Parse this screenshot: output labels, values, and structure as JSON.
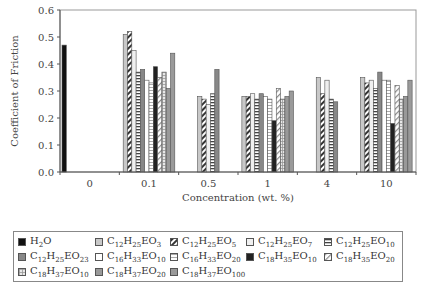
{
  "chart_data": {
    "type": "bar",
    "title": "",
    "xlabel": "Concentration (wt. %)",
    "ylabel": "Coefficient of Friction",
    "ylim": [
      0.0,
      0.6
    ],
    "yticks": [
      "0.0",
      "0.1",
      "0.2",
      "0.3",
      "0.4",
      "0.5",
      "0.6"
    ],
    "grid": false,
    "legend_position": "bottom",
    "categories": [
      "0",
      "0.1",
      "0.5",
      "1",
      "4",
      "10"
    ],
    "series": [
      {
        "name": "H2O",
        "label_html": "H<sub>2</sub>O",
        "fill": "#111111",
        "pattern": "solid",
        "values": [
          0.47,
          null,
          null,
          null,
          null,
          null
        ]
      },
      {
        "name": "C12H25EO3",
        "label_html": "C<sub>12</sub>H<sub>25</sub>EO<sub>3</sub>",
        "fill": "#c8c8c8",
        "pattern": "solid",
        "values": [
          null,
          0.51,
          0.28,
          0.28,
          0.35,
          0.35
        ]
      },
      {
        "name": "C12H25EO5",
        "label_html": "C<sub>12</sub>H<sub>25</sub>EO<sub>5</sub>",
        "fill": "#ffffff",
        "pattern": "diag-dark",
        "values": [
          null,
          0.52,
          0.27,
          0.28,
          0.29,
          0.33
        ]
      },
      {
        "name": "C12H25EO7",
        "label_html": "C<sub>12</sub>H<sub>25</sub>EO<sub>7</sub>",
        "fill": "#f0f0f0",
        "pattern": "solid",
        "values": [
          null,
          0.45,
          0.25,
          0.29,
          0.34,
          0.34
        ]
      },
      {
        "name": "C12H25EO10",
        "label_html": "C<sub>12</sub>H<sub>25</sub>EO<sub>10</sub>",
        "fill": "#ffffff",
        "pattern": "hlines",
        "values": [
          null,
          0.37,
          0.29,
          0.27,
          0.27,
          0.31
        ]
      },
      {
        "name": "C12H25EO23",
        "label_html": "C<sub>12</sub>H<sub>25</sub>EO<sub>23</sub>",
        "fill": "#888888",
        "pattern": "solid",
        "values": [
          null,
          0.38,
          0.38,
          0.29,
          0.26,
          0.37
        ]
      },
      {
        "name": "C16H33EO10",
        "label_html": "C<sub>16</sub>H<sub>33</sub>EO<sub>10</sub>",
        "fill": "#ffffff",
        "pattern": "solid",
        "values": [
          null,
          0.34,
          null,
          0.28,
          null,
          0.34
        ]
      },
      {
        "name": "C16H33EO20",
        "label_html": "C<sub>16</sub>H<sub>33</sub>EO<sub>20</sub>",
        "fill": "#ffffff",
        "pattern": "hlines-light",
        "values": [
          null,
          0.33,
          null,
          0.27,
          null,
          0.34
        ]
      },
      {
        "name": "C18H35EO10",
        "label_html": "C<sub>18</sub>H<sub>35</sub>EO<sub>10</sub>",
        "fill": "#222222",
        "pattern": "solid",
        "values": [
          null,
          0.39,
          null,
          0.19,
          null,
          0.18
        ]
      },
      {
        "name": "C18H35EO20",
        "label_html": "C<sub>18</sub>H<sub>35</sub>EO<sub>20</sub>",
        "fill": "#ffffff",
        "pattern": "diag-light",
        "values": [
          null,
          0.35,
          null,
          0.31,
          null,
          0.32
        ]
      },
      {
        "name": "C18H37EO10",
        "label_html": "C<sub>18</sub>H<sub>37</sub>EO<sub>10</sub>",
        "fill": "#d8d8d8",
        "pattern": "grid-light",
        "values": [
          null,
          0.37,
          null,
          0.27,
          null,
          0.27
        ]
      },
      {
        "name": "C18H37EO20",
        "label_html": "C<sub>18</sub>H<sub>37</sub>EO<sub>20</sub>",
        "fill": "#999999",
        "pattern": "solid",
        "values": [
          null,
          0.31,
          null,
          0.28,
          null,
          0.28
        ]
      },
      {
        "name": "C18H37EO100",
        "label_html": "C<sub>18</sub>H<sub>37</sub>EO<sub>100</sub>",
        "fill": "#9a9a9a",
        "pattern": "solid",
        "values": [
          null,
          0.44,
          null,
          0.3,
          null,
          0.34
        ]
      }
    ],
    "group_series_order": {
      "0": [
        0
      ],
      "0.1": [
        1,
        2,
        3,
        4,
        5,
        6,
        7,
        8,
        9,
        10,
        11,
        12
      ],
      "0.5": [
        1,
        2,
        3,
        4,
        5
      ],
      "1": [
        1,
        2,
        3,
        4,
        5,
        6,
        7,
        8,
        9,
        10,
        11,
        12
      ],
      "4": [
        1,
        2,
        3,
        4,
        5
      ],
      "10": [
        1,
        2,
        3,
        4,
        5,
        6,
        7,
        8,
        9,
        10,
        11,
        12
      ]
    }
  },
  "legend": {
    "rows": [
      [
        0,
        1,
        2,
        3,
        4
      ],
      [
        5,
        6,
        7,
        8,
        9
      ],
      [
        10,
        11,
        12
      ]
    ]
  }
}
